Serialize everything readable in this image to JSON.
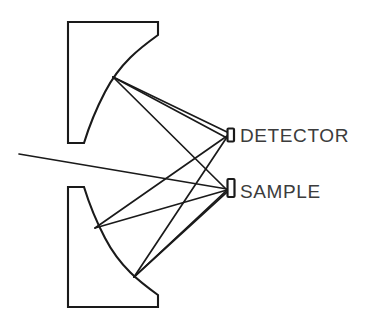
{
  "figure": {
    "background_color": "#ffffff",
    "line_color": "#1a1a1a",
    "text_color": "#3c3c3c",
    "width": 377,
    "height": 328
  },
  "labels": {
    "detector": "DETECTOR",
    "sample": "SAMPLE"
  },
  "components": {
    "upper_mirror": {
      "name": "upper-curved-mirror",
      "outline_path": "M 68 22 L 158 22 L 158 35 C 140 48 120 63 105 92 C 94 113 88 130 84 143 L 68 143 Z"
    },
    "lower_mirror": {
      "name": "lower-curved-mirror",
      "outline_path": "M 68 187 L 84 187 C 88 200 94 217 105 238 C 120 267 140 282 158 295 L 158 307 L 68 307 Z"
    },
    "detector_marker": {
      "name": "detector-marker",
      "x": 227.5,
      "y": 128.5,
      "width": 6.5,
      "height": 13
    },
    "sample_marker": {
      "name": "sample-marker",
      "x": 227.5,
      "y": 179,
      "width": 7,
      "height": 18
    }
  },
  "geometry": {
    "upper_mirror_focus": {
      "x": 113,
      "y": 77
    },
    "lower_mirror_upper_point": {
      "x": 95,
      "y": 228
    },
    "lower_mirror_lower_point": {
      "x": 134,
      "y": 277
    },
    "detector_point": {
      "x": 227,
      "y": 135
    },
    "sample_point": {
      "x": 227,
      "y": 189
    },
    "incoming_beam_origin": {
      "x": 19,
      "y": 154
    }
  },
  "rays": [
    {
      "name": "incoming-beam-to-sample",
      "d": "M 19 154 L 227 189"
    },
    {
      "name": "upper-mirror-to-detector-upper",
      "d": "M 113 77 L 227 132"
    },
    {
      "name": "upper-mirror-to-detector-lower",
      "d": "M 113 77 L 227 138"
    },
    {
      "name": "upper-mirror-to-sample",
      "d": "M 113 77 L 227 190"
    },
    {
      "name": "sample-to-lower-mirror-upper",
      "d": "M 227 190 L 95 228"
    },
    {
      "name": "sample-to-lower-mirror-lower",
      "d": "M 227 190 L 134 277"
    },
    {
      "name": "lower-mirror-upper-to-detector",
      "d": "M 95 228 L 227 136"
    },
    {
      "name": "lower-mirror-lower-to-detector",
      "d": "M 134 277 L 227 137"
    },
    {
      "name": "lower-mirror-lower-to-sample",
      "d": "M 134 277 L 227 192"
    }
  ],
  "text_positions": {
    "detector": {
      "x": 240,
      "y": 142
    },
    "sample": {
      "x": 240,
      "y": 198
    }
  }
}
